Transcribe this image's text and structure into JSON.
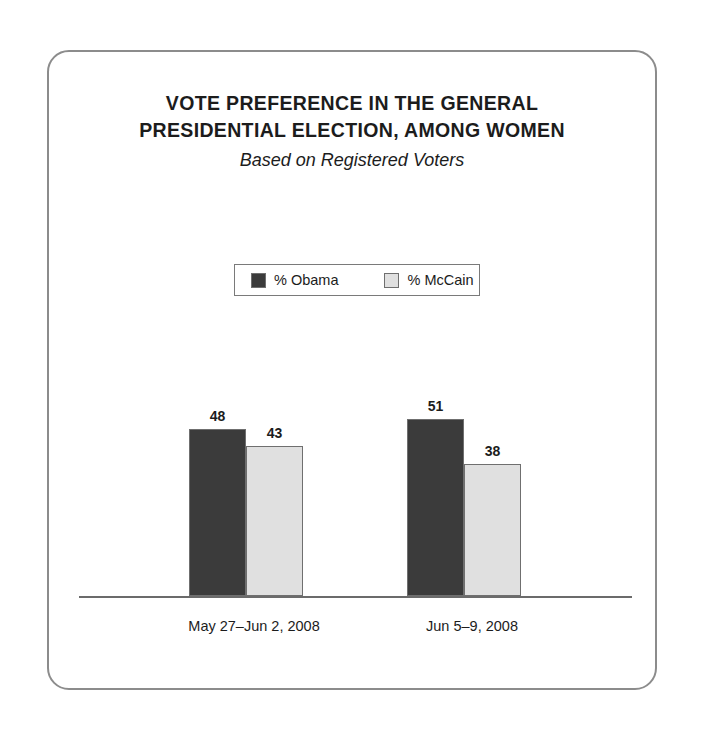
{
  "chart_data": {
    "type": "bar",
    "title": "VOTE PREFERENCE IN THE GENERAL PRESIDENTIAL ELECTION, AMONG WOMEN",
    "title_lines": [
      "VOTE PREFERENCE IN THE GENERAL",
      "PRESIDENTIAL ELECTION, AMONG WOMEN"
    ],
    "subtitle": "Based on Registered Voters",
    "xlabel": "",
    "ylabel": "",
    "ylim": [
      0,
      60
    ],
    "grid": false,
    "legend_position": "top-center",
    "categories": [
      "May 27–Jun 2, 2008",
      "Jun 5–9, 2008"
    ],
    "series": [
      {
        "name": "% Obama",
        "color": "#3b3b3b",
        "values": [
          48,
          51
        ]
      },
      {
        "name": "% McCain",
        "color": "#e0e0e0",
        "values": [
          43,
          38
        ]
      }
    ]
  },
  "colors": {
    "obama": "#3b3b3b",
    "mccain": "#e0e0e0",
    "border": "#8c8c8c",
    "axis": "#6b6b6b",
    "text": "#1c1c1c"
  }
}
